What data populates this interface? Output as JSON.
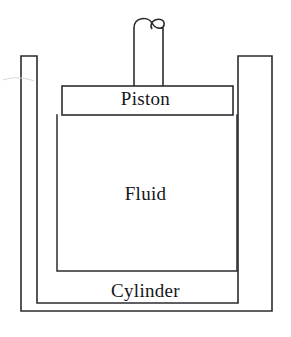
{
  "diagram": {
    "type": "line-drawing",
    "background_color": "#ffffff",
    "stroke_color": "#2b2c30",
    "text_color": "#15161a",
    "canvas": {
      "width": 291,
      "height": 337
    },
    "labels": {
      "piston": "Piston",
      "fluid": "Fluid",
      "cylinder": "Cylinder"
    },
    "parts": [
      {
        "name": "piston-rod",
        "label": "",
        "description": "vertical rod rising from the piston with a rounded looped cap at the top",
        "x_left": 134,
        "x_right": 163,
        "y_top": 22,
        "y_bottom": 86
      },
      {
        "name": "piston-plate",
        "label": "Piston",
        "description": "horizontal rectangular plate inside the cylinder",
        "x_left": 62,
        "x_right": 233,
        "y_top": 86,
        "y_bottom": 115
      },
      {
        "name": "fluid-chamber",
        "label": "Fluid",
        "description": "region enclosed below the piston inside the cylinder bore",
        "x_left": 57,
        "x_right": 237,
        "y_top": 115,
        "y_bottom": 271
      },
      {
        "name": "cylinder-body",
        "label": "Cylinder",
        "description": "outer U shaped vessel with thick left and right walls and a base",
        "x_left": 21,
        "x_right": 272,
        "y_top": 56,
        "y_bottom": 311
      }
    ]
  }
}
